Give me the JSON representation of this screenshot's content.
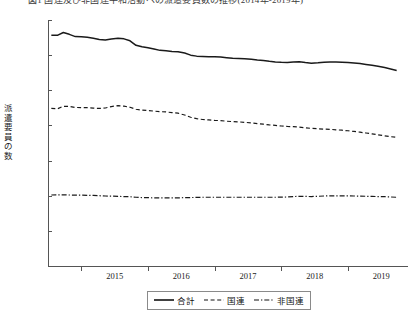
{
  "title": "図1 国連及び非国連平和活動への派遣要員数の推移(2014年-2019年)",
  "chart_data": {
    "type": "line",
    "title": "図1 国連及び非国連平和活動への派遣要員数の推移(2014年-2019年)",
    "xlabel": "",
    "ylabel": "派遣要員の数",
    "ylim": [
      0,
      175000
    ],
    "xlim": [
      2014.5,
      2019.9
    ],
    "grid": false,
    "legend_position": "bottom-center",
    "ytick_labels": [
      "0",
      "25000",
      "50000",
      "75000",
      "100000",
      "125000",
      "150000",
      "175000"
    ],
    "ytick_values": [
      0,
      25000,
      50000,
      75000,
      100000,
      125000,
      150000,
      175000
    ],
    "xtick_labels": [
      "2015",
      "2016",
      "2017",
      "2018",
      "2019"
    ],
    "xtick_values": [
      2015,
      2016,
      2017,
      2018,
      2019
    ],
    "x": [
      2014.55,
      2014.64,
      2014.73,
      2014.82,
      2014.91,
      2015.0,
      2015.09,
      2015.18,
      2015.27,
      2015.36,
      2015.45,
      2015.55,
      2015.64,
      2015.73,
      2015.82,
      2015.91,
      2016.0,
      2016.09,
      2016.18,
      2016.27,
      2016.36,
      2016.45,
      2016.55,
      2016.64,
      2016.73,
      2016.82,
      2016.91,
      2017.0,
      2017.09,
      2017.18,
      2017.27,
      2017.36,
      2017.45,
      2017.55,
      2017.64,
      2017.73,
      2017.82,
      2017.91,
      2018.0,
      2018.09,
      2018.18,
      2018.27,
      2018.36,
      2018.45,
      2018.55,
      2018.64,
      2018.73,
      2018.82,
      2018.91,
      2019.0,
      2019.09,
      2019.18,
      2019.27,
      2019.36,
      2019.45,
      2019.55,
      2019.64,
      2019.73
    ],
    "series": [
      {
        "name": "合計",
        "style": "solid",
        "color": "#1a1a1a",
        "values": [
          164200,
          164100,
          166100,
          164800,
          163200,
          163100,
          162700,
          162000,
          161200,
          160700,
          161500,
          162000,
          161600,
          160200,
          157000,
          155900,
          155200,
          154300,
          153400,
          153100,
          152600,
          152400,
          151500,
          150000,
          149300,
          149100,
          148900,
          148800,
          148700,
          148200,
          147800,
          147600,
          147400,
          147100,
          146600,
          146200,
          145600,
          145100,
          144900,
          144800,
          145100,
          145300,
          144700,
          144300,
          144600,
          145000,
          145200,
          145100,
          145000,
          144800,
          144400,
          144000,
          143400,
          142800,
          142100,
          141200,
          140200,
          139100
        ]
      },
      {
        "name": "国連",
        "style": "dashed",
        "color": "#1a1a1a",
        "values": [
          112100,
          111800,
          113600,
          113500,
          112800,
          112700,
          112600,
          112300,
          112100,
          112400,
          113400,
          114100,
          113700,
          112900,
          111500,
          110900,
          110600,
          110200,
          109800,
          109600,
          109100,
          108700,
          107400,
          105800,
          104800,
          104200,
          103900,
          103600,
          103400,
          103000,
          102700,
          102500,
          102200,
          101800,
          101300,
          100900,
          100400,
          100000,
          99600,
          99300,
          99100,
          98800,
          98300,
          97900,
          97600,
          97400,
          97200,
          96900,
          96600,
          96200,
          95700,
          95200,
          94600,
          94000,
          93300,
          92600,
          92000,
          91600
        ]
      },
      {
        "name": "非国連",
        "style": "dashdot",
        "color": "#1a1a1a",
        "values": [
          50500,
          50600,
          50600,
          50500,
          50400,
          50400,
          50300,
          50200,
          50000,
          49800,
          49700,
          49500,
          49400,
          49300,
          48900,
          48700,
          48600,
          48500,
          48400,
          48400,
          48400,
          48500,
          48600,
          48700,
          48800,
          48900,
          48900,
          48900,
          48900,
          48900,
          48900,
          48900,
          48900,
          48900,
          48900,
          48900,
          48900,
          48900,
          49000,
          49100,
          49400,
          49600,
          49500,
          49400,
          49600,
          49800,
          49900,
          49900,
          49900,
          49900,
          49800,
          49700,
          49600,
          49500,
          49400,
          49300,
          49100,
          48900
        ]
      }
    ]
  },
  "legend": {
    "items": [
      {
        "label": "合計",
        "style": "solid"
      },
      {
        "label": "国連",
        "style": "dashed"
      },
      {
        "label": "非国連",
        "style": "dashdot"
      }
    ]
  },
  "axes": {
    "y_title_chars": [
      "派",
      "遣",
      "要",
      "員",
      "の",
      "数"
    ]
  }
}
